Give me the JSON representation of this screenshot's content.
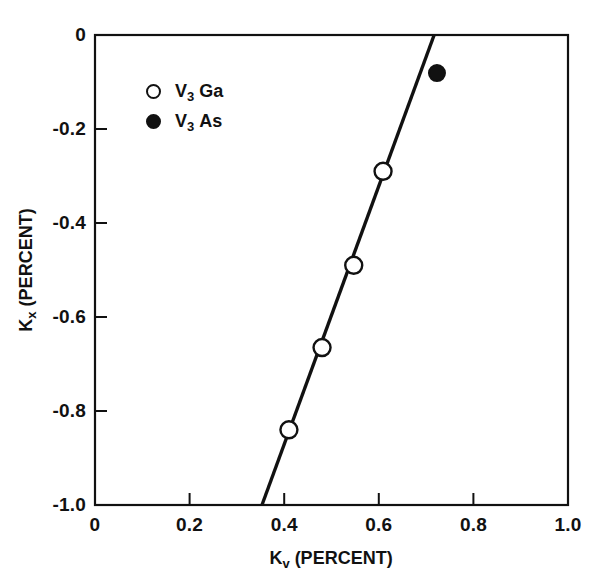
{
  "chart_data": {
    "type": "scatter",
    "title": "",
    "xlabel": "K_v (PERCENT)",
    "ylabel": "K_x (PERCENT)",
    "xlabel_base": "K",
    "xlabel_sub": "v",
    "xlabel_units": "(PERCENT)",
    "ylabel_base": "K",
    "ylabel_sub": "x",
    "ylabel_units": "(PERCENT)",
    "xlim": [
      0,
      1.0
    ],
    "ylim": [
      -1.0,
      0
    ],
    "grid": false,
    "legend_position": "upper-left-inside",
    "xticks": [
      "0",
      "0.2",
      "0.4",
      "0.6",
      "0.8",
      "1.0"
    ],
    "xtick_values": [
      0,
      0.2,
      0.4,
      0.6,
      0.8,
      1.0
    ],
    "yticks": [
      "0",
      "-0.2",
      "-0.4",
      "-0.6",
      "-0.8",
      "-1.0"
    ],
    "ytick_values": [
      0,
      -0.2,
      -0.4,
      -0.6,
      -0.8,
      -1.0
    ],
    "series": [
      {
        "name": "V3 Ga",
        "label_base": "V",
        "label_sub": "3",
        "label_tail": "Ga",
        "marker": "open-circle",
        "color": "#111111",
        "points": [
          {
            "x": 0.41,
            "y": -0.84
          },
          {
            "x": 0.48,
            "y": -0.665
          },
          {
            "x": 0.547,
            "y": -0.49
          },
          {
            "x": 0.609,
            "y": -0.29
          }
        ]
      },
      {
        "name": "V3 As",
        "label_base": "V",
        "label_sub": "3",
        "label_tail": "As",
        "marker": "filled-circle",
        "color": "#111111",
        "points": [
          {
            "x": 0.723,
            "y": -0.081
          }
        ]
      }
    ],
    "fit_line": {
      "name": "linear-fit",
      "x0": 0.353,
      "y0": -1.0,
      "x1": 0.717,
      "y1": 0.0,
      "color": "#111111"
    }
  },
  "legend": {
    "entries": [
      {
        "marker": "open-circle",
        "base": "V",
        "sub": "3",
        "tail": "Ga"
      },
      {
        "marker": "filled-circle",
        "base": "V",
        "sub": "3",
        "tail": "As"
      }
    ]
  }
}
